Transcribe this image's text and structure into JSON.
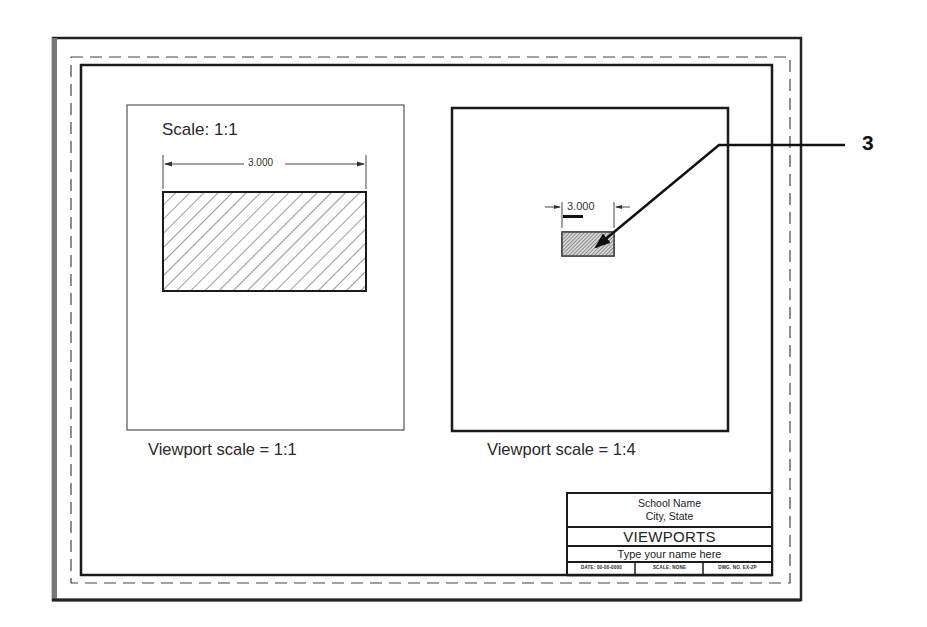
{
  "drawing": {
    "callout_number": "3",
    "left_viewport": {
      "scale_note": "Scale: 1:1",
      "dimension": "3.000",
      "label": "Viewport scale = 1:1"
    },
    "right_viewport": {
      "dimension": "3.000",
      "label": "Viewport scale = 1:4"
    }
  },
  "title_block": {
    "school": "School Name",
    "city": "City, State",
    "title": "VIEWPORTS",
    "name": "Type your name here",
    "date": "DATE: 00-00-0000",
    "scale": "SCALE: NONE",
    "dwg_no": "DWG. NO. EX-2P"
  },
  "colors": {
    "line": "#1a1a1a",
    "thin_line": "#555555",
    "hatch": "#333333",
    "sheet_shadow": "#888888",
    "background": "#ffffff"
  }
}
